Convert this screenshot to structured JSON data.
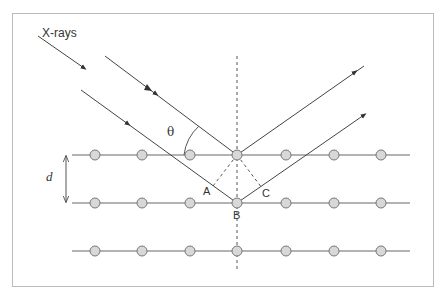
{
  "diagram": {
    "labels": {
      "xrays": "X-rays",
      "theta": "θ",
      "d": "d",
      "A": "A",
      "B": "B",
      "C": "C"
    },
    "colors": {
      "line": "#555555",
      "atom_fill": "#d8d8d8",
      "atom_stroke": "#777777",
      "frame": "#bbbbbb"
    },
    "lattice": {
      "rows_y": [
        155,
        203,
        251
      ],
      "atoms_x": [
        95,
        142,
        190,
        237,
        286,
        334,
        381
      ],
      "row_x_start": 72,
      "row_x_end": 410
    }
  }
}
